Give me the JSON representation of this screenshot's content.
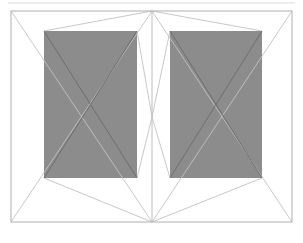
{
  "document": {
    "title": "Double Panel Elevation Drawing",
    "canvas": {
      "width": 303,
      "height": 243,
      "background": "#ffffff"
    }
  },
  "palette": {
    "background": "#ffffff",
    "panel_fill": "#8c8c8c",
    "frame_stroke": "#b0b0b0",
    "diagonal_stroke_dark": "#6e6e6e",
    "diagonal_stroke_light": "#c2c2c2",
    "mullion_stroke": "#bdbdbd",
    "header_rule_stroke": "#dcdcdc"
  },
  "geometry": {
    "outer_frame": {
      "x": 11,
      "y": 11,
      "width": 281,
      "height": 211
    },
    "mullion_x": 152,
    "header_rule": {
      "x1": 8,
      "y1": 3,
      "x2": 295,
      "y2": 3
    },
    "left_panel": {
      "x": 11,
      "y": 11,
      "width": 141,
      "height": 211
    },
    "right_panel": {
      "x": 152,
      "y": 11,
      "width": 140,
      "height": 211
    },
    "left_glass": {
      "x": 44,
      "y": 31,
      "width": 93,
      "height": 147
    },
    "right_glass": {
      "x": 170,
      "y": 31,
      "width": 92,
      "height": 147
    },
    "center_node": {
      "x": 152,
      "y": 117
    },
    "apex_top": {
      "x": 152,
      "y": 11
    },
    "apex_bottom": {
      "x": 152,
      "y": 222
    }
  },
  "elements": {
    "outer_frame_label": "Outer frame",
    "mullion_label": "Center mullion",
    "left_glass_label": "Left glazed panel",
    "right_glass_label": "Right glazed panel",
    "left_panel_label": "Left leaf",
    "right_panel_label": "Right leaf",
    "header_rule_label": "Header rule"
  },
  "chart_data": {
    "type": "diagram",
    "xlabel": "",
    "ylabel": "",
    "shapes": [
      {
        "name": "outer-frame",
        "kind": "rect",
        "x": 11,
        "y": 11,
        "width": 281,
        "height": 211,
        "fill": "none",
        "stroke": "#b0b0b0"
      },
      {
        "name": "center-mullion",
        "kind": "line",
        "x1": 152,
        "y1": 11,
        "x2": 152,
        "y2": 222,
        "stroke": "#bdbdbd"
      },
      {
        "name": "header-rule",
        "kind": "line",
        "x1": 8,
        "y1": 3,
        "x2": 295,
        "y2": 3,
        "stroke": "#dcdcdc"
      },
      {
        "name": "left-glass",
        "kind": "rect",
        "x": 44,
        "y": 31,
        "width": 93,
        "height": 147,
        "fill": "#8c8c8c",
        "stroke": "none"
      },
      {
        "name": "right-glass",
        "kind": "rect",
        "x": 170,
        "y": 31,
        "width": 92,
        "height": 147,
        "fill": "#8c8c8c",
        "stroke": "none"
      },
      {
        "name": "left-leaf-diagonal-down",
        "kind": "line",
        "x1": 11,
        "y1": 11,
        "x2": 152,
        "y2": 222,
        "stroke": "#c2c2c2"
      },
      {
        "name": "left-leaf-diagonal-up",
        "kind": "line",
        "x1": 11,
        "y1": 222,
        "x2": 152,
        "y2": 11,
        "stroke": "#c2c2c2"
      },
      {
        "name": "right-leaf-diagonal-down",
        "kind": "line",
        "x1": 152,
        "y1": 11,
        "x2": 292,
        "y2": 222,
        "stroke": "#c2c2c2"
      },
      {
        "name": "right-leaf-diagonal-up",
        "kind": "line",
        "x1": 152,
        "y1": 222,
        "x2": 292,
        "y2": 11,
        "stroke": "#c2c2c2"
      },
      {
        "name": "left-glass-diagonal-down",
        "kind": "line",
        "x1": 44,
        "y1": 31,
        "x2": 137,
        "y2": 178,
        "stroke": "#6e6e6e"
      },
      {
        "name": "left-glass-diagonal-up",
        "kind": "line",
        "x1": 44,
        "y1": 178,
        "x2": 137,
        "y2": 31,
        "stroke": "#6e6e6e"
      },
      {
        "name": "right-glass-diagonal-down",
        "kind": "line",
        "x1": 170,
        "y1": 31,
        "x2": 262,
        "y2": 178,
        "stroke": "#6e6e6e"
      },
      {
        "name": "right-glass-diagonal-up",
        "kind": "line",
        "x1": 170,
        "y1": 178,
        "x2": 262,
        "y2": 31,
        "stroke": "#6e6e6e"
      },
      {
        "name": "left-glass-to-apex-top",
        "kind": "line",
        "x1": 44,
        "y1": 31,
        "x2": 152,
        "y2": 11,
        "stroke": "#c2c2c2"
      },
      {
        "name": "left-glass-to-apex-bottom",
        "kind": "line",
        "x1": 44,
        "y1": 178,
        "x2": 152,
        "y2": 222,
        "stroke": "#c2c2c2"
      },
      {
        "name": "right-glass-to-apex-top",
        "kind": "line",
        "x1": 262,
        "y1": 31,
        "x2": 152,
        "y2": 11,
        "stroke": "#c2c2c2"
      },
      {
        "name": "right-glass-to-apex-bottom",
        "kind": "line",
        "x1": 262,
        "y1": 178,
        "x2": 152,
        "y2": 222,
        "stroke": "#c2c2c2"
      },
      {
        "name": "center-node-left-up",
        "kind": "line",
        "x1": 137,
        "y1": 31,
        "x2": 152,
        "y2": 117,
        "stroke": "#c2c2c2"
      },
      {
        "name": "center-node-left-down",
        "kind": "line",
        "x1": 137,
        "y1": 178,
        "x2": 152,
        "y2": 117,
        "stroke": "#c2c2c2"
      },
      {
        "name": "center-node-right-up",
        "kind": "line",
        "x1": 170,
        "y1": 31,
        "x2": 152,
        "y2": 117,
        "stroke": "#c2c2c2"
      },
      {
        "name": "center-node-right-down",
        "kind": "line",
        "x1": 170,
        "y1": 178,
        "x2": 152,
        "y2": 117,
        "stroke": "#c2c2c2"
      }
    ]
  }
}
